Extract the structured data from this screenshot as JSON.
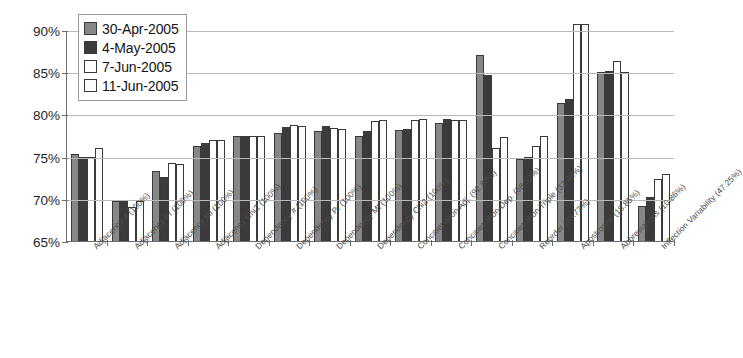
{
  "chart_data": {
    "type": "bar",
    "title": "",
    "xlabel": "",
    "ylabel": "",
    "ylim": [
      65,
      90
    ],
    "ytick_labels": [
      "90%",
      "85%",
      "80%",
      "75%",
      "70%",
      "65%"
    ],
    "ytick_values": [
      90,
      85,
      80,
      75,
      70,
      65
    ],
    "grid": true,
    "legend_position": "top-left",
    "categories": [
      "Adjacency # (100%)",
      "Adjacency Pr (100%)",
      "Adjacency MI (100%)",
      "Adjacency Chi2 (100%)",
      "Dependency # (100%)",
      "Dependency Pr (100%)",
      "Dependency MI (100%)",
      "Dependency Chi2 (100%)",
      "Concatenation Adj. (92.82%)",
      "Concatenation Dep. (68.52%)",
      "Concatenation Triple (32.48%)",
      "Reorder (63.73%)",
      "Apostrophe (18.85%)",
      "Abbreviations (10.86%)",
      "Inflection Variability (47.25%)"
    ],
    "series": [
      {
        "name": "30-Apr-2005",
        "color": "#878787",
        "values": [
          75.3,
          69.8,
          73.3,
          76.3,
          77.4,
          77.8,
          78.0,
          77.5,
          78.2,
          79.0,
          87.0,
          74.7,
          81.4,
          85.0,
          69.2
        ]
      },
      {
        "name": "4-May-2005",
        "color": "#3b3b3b",
        "values": [
          75.0,
          69.8,
          72.6,
          76.6,
          77.5,
          78.5,
          78.6,
          78.0,
          78.3,
          79.5,
          84.7,
          74.9,
          81.8,
          85.1,
          70.2
        ]
      },
      {
        "name": "7-Jun-2005",
        "color": "#ffffff",
        "values": [
          74.9,
          69.0,
          74.3,
          77.0,
          77.5,
          78.7,
          78.4,
          79.2,
          79.3,
          79.3,
          76.0,
          76.2,
          90.7,
          86.3,
          72.3
        ]
      },
      {
        "name": "11-Jun-2005",
        "color": "#fcfcfc",
        "values": [
          76.0,
          69.8,
          74.1,
          77.0,
          77.5,
          78.6,
          78.3,
          79.3,
          79.4,
          79.3,
          77.3,
          77.5,
          90.7,
          85.0,
          72.9
        ]
      }
    ]
  }
}
